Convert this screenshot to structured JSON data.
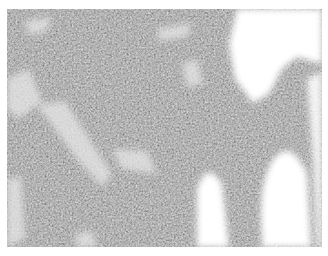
{
  "image": {
    "kind": "histology-micrograph",
    "colormode": "grayscale",
    "description": "Dense sheet of small round cells with darkly stained nuclei; white empty spaces at upper-right and lower-right edges; pale fibrous streaks crossing the tissue",
    "colors": {
      "background": "#ffffff",
      "tissue_mid": "#8a8a8a",
      "nuclei": "#2a2a2a",
      "stroma": "#d8d8d8"
    }
  }
}
